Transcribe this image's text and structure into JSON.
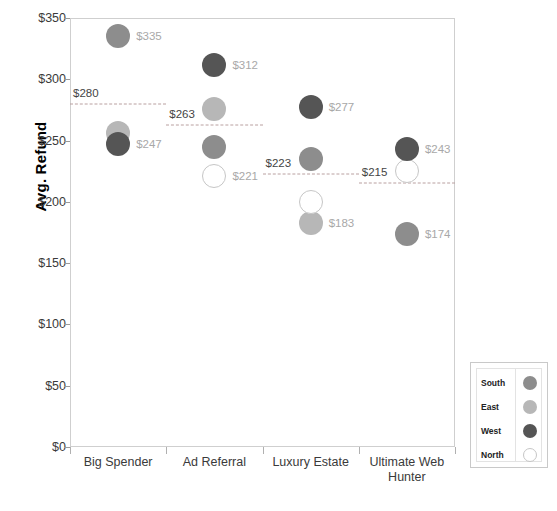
{
  "chart_data": {
    "type": "scatter",
    "title": "",
    "xlabel": "",
    "ylabel": "Avg. Refund",
    "categories": [
      "Big Spender",
      "Ad Referral",
      "Luxury Estate",
      "Ultimate Web\nHunter"
    ],
    "ylim": [
      0,
      350
    ],
    "ytick_labels": [
      "$0",
      "$50",
      "$100",
      "$150",
      "$200",
      "$250",
      "$300",
      "$350"
    ],
    "ytick_values": [
      0,
      50,
      100,
      150,
      200,
      250,
      300,
      350
    ],
    "grid": false,
    "legend_position": "bottom-right",
    "series": [
      {
        "name": "South",
        "color": "#8d8d8d",
        "values": [
          335,
          245,
          235,
          174
        ]
      },
      {
        "name": "East",
        "color": "#b7b7b7",
        "values": [
          256,
          276,
          183,
          null
        ]
      },
      {
        "name": "West",
        "color": "#555555",
        "values": [
          247,
          312,
          277,
          243
        ]
      },
      {
        "name": "North",
        "color": "#ffffff",
        "values": [
          null,
          221,
          200,
          225
        ]
      }
    ],
    "point_labels": [
      {
        "category": "Big Spender",
        "series": "South",
        "text": "$335",
        "value": 335
      },
      {
        "category": "Big Spender",
        "series": "West",
        "text": "$247",
        "value": 247
      },
      {
        "category": "Ad Referral",
        "series": "West",
        "text": "$312",
        "value": 312
      },
      {
        "category": "Ad Referral",
        "series": "North",
        "text": "$221",
        "value": 221
      },
      {
        "category": "Luxury Estate",
        "series": "West",
        "text": "$277",
        "value": 277
      },
      {
        "category": "Luxury Estate",
        "series": "East",
        "text": "$183",
        "value": 183
      },
      {
        "category": "Ultimate Web Hunter",
        "series": "West",
        "text": "$243",
        "value": 243
      },
      {
        "category": "Ultimate Web Hunter",
        "series": "South",
        "text": "$174",
        "value": 174
      }
    ],
    "reference_lines": [
      {
        "category": "Big Spender",
        "text": "$280",
        "value": 280
      },
      {
        "category": "Ad Referral",
        "text": "$263",
        "value": 263
      },
      {
        "category": "Luxury Estate",
        "text": "$223",
        "value": 223
      },
      {
        "category": "Ultimate Web Hunter",
        "text": "$215",
        "value": 215
      }
    ],
    "legend": {
      "entries": [
        {
          "label": "South",
          "color": "#8d8d8d",
          "hollow": false
        },
        {
          "label": "East",
          "color": "#b7b7b7",
          "hollow": false
        },
        {
          "label": "West",
          "color": "#555555",
          "hollow": false
        },
        {
          "label": "North",
          "color": "#ffffff",
          "hollow": true
        }
      ]
    }
  }
}
